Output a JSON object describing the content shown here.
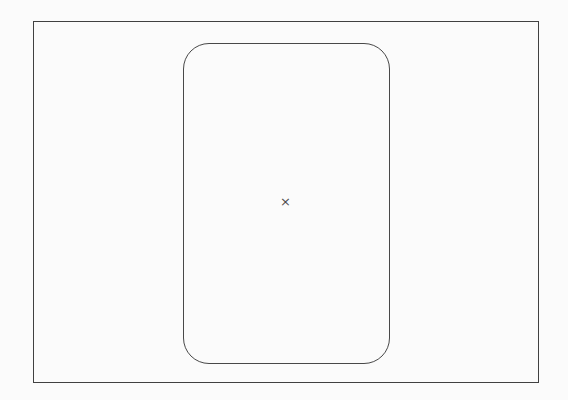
{
  "figure": {
    "background_color": "#fbfbfb",
    "outer_rectangle": {
      "line_color": "#414141"
    },
    "rounded_rectangle": {
      "line_color": "#484848"
    },
    "center_mark": {
      "glyph": "×",
      "color": "#4d4d4d"
    }
  }
}
